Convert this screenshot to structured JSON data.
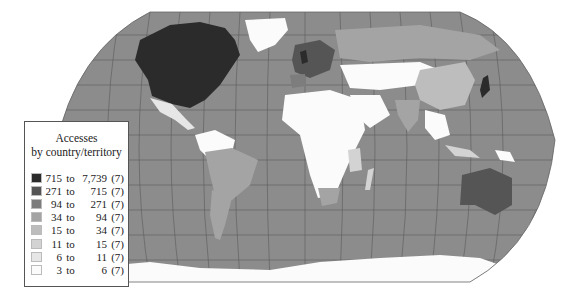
{
  "legend": {
    "title_line1": "Accesses",
    "title_line2": "by country/territory",
    "rows": [
      {
        "lo": "715",
        "to": "to",
        "hi": "7,739",
        "count": "(7)",
        "color": "#2b2b2b"
      },
      {
        "lo": "271",
        "to": "to",
        "hi": "715",
        "count": "(7)",
        "color": "#555555"
      },
      {
        "lo": "94",
        "to": "to",
        "hi": "271",
        "count": "(7)",
        "color": "#7d7d7d"
      },
      {
        "lo": "34",
        "to": "to",
        "hi": "94",
        "count": "(7)",
        "color": "#a4a4a4"
      },
      {
        "lo": "15",
        "to": "to",
        "hi": "34",
        "count": "(7)",
        "color": "#bdbdbd"
      },
      {
        "lo": "11",
        "to": "to",
        "hi": "15",
        "count": "(7)",
        "color": "#d3d3d3"
      },
      {
        "lo": "6",
        "to": "to",
        "hi": "11",
        "count": "(7)",
        "color": "#e6e6e6"
      },
      {
        "lo": "3",
        "to": "to",
        "hi": "6",
        "count": "(7)",
        "color": "#fbfbfb"
      }
    ]
  },
  "map": {
    "projection": "Robinson-like world map",
    "ocean_color": "#8c8c8c",
    "no_data_color": "#ffffff",
    "regions": [
      {
        "name": "North America (USA/Canada)",
        "class": "715 to 7,739"
      },
      {
        "name": "Mexico",
        "class": "6 to 11"
      },
      {
        "name": "Greenland",
        "class": "3 to 6"
      },
      {
        "name": "Western Europe",
        "class": "271 to 715"
      },
      {
        "name": "Japan",
        "class": "715 to 7,739"
      },
      {
        "name": "Australia",
        "class": "271 to 715"
      },
      {
        "name": "China",
        "class": "15 to 34"
      },
      {
        "name": "Brazil",
        "class": "34 to 94"
      },
      {
        "name": "Argentina",
        "class": "34 to 94"
      },
      {
        "name": "South Africa",
        "class": "34 to 94"
      },
      {
        "name": "India",
        "class": "34 to 94"
      },
      {
        "name": "Russia",
        "class": "34 to 94"
      }
    ]
  }
}
